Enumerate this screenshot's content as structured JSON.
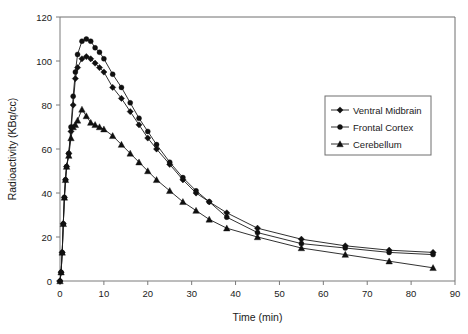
{
  "chart_data": {
    "type": "line",
    "title": "",
    "xlabel": "Time (min)",
    "ylabel": "Radioactivity (KBq/cc)",
    "xlim": [
      0,
      90
    ],
    "ylim": [
      0,
      120
    ],
    "xticks": [
      0,
      10,
      20,
      30,
      40,
      50,
      60,
      70,
      80,
      90
    ],
    "yticks": [
      0,
      20,
      40,
      60,
      80,
      100,
      120
    ],
    "grid": false,
    "legend_position": "right-top",
    "series": [
      {
        "name": "Ventral Midbrain",
        "marker": "diamond",
        "color": "#101010",
        "x": [
          0,
          0.25,
          0.5,
          0.75,
          1,
          1.25,
          1.5,
          2,
          2.5,
          3,
          3.5,
          4,
          5,
          6,
          7,
          8,
          9,
          10,
          12,
          14,
          16,
          18,
          20,
          22,
          25,
          28,
          31,
          34,
          38,
          45,
          55,
          65,
          75,
          85
        ],
        "y": [
          0,
          4,
          13,
          26,
          38,
          46,
          52,
          58,
          68,
          80,
          92,
          97,
          101,
          102,
          101,
          99,
          97,
          95,
          88,
          83,
          77,
          71,
          65,
          60,
          53,
          46,
          40,
          36,
          31,
          24,
          19,
          16,
          14,
          13
        ]
      },
      {
        "name": "Frontal Cortex",
        "marker": "circle",
        "color": "#101010",
        "x": [
          0,
          0.25,
          0.5,
          0.75,
          1,
          1.25,
          1.5,
          2,
          2.5,
          3,
          3.5,
          4,
          5,
          6,
          7,
          8,
          9,
          10,
          12,
          14,
          16,
          18,
          20,
          22,
          25,
          28,
          31,
          34,
          38,
          45,
          55,
          65,
          75,
          85
        ],
        "y": [
          0,
          4,
          13,
          26,
          38,
          46,
          52,
          58,
          70,
          84,
          95,
          103,
          109,
          110,
          109,
          106,
          104,
          101,
          94,
          88,
          81,
          74,
          68,
          62,
          54,
          47,
          41,
          36,
          29,
          22,
          17,
          15,
          13,
          12
        ]
      },
      {
        "name": "Cerebellum",
        "marker": "triangle",
        "color": "#101010",
        "x": [
          0,
          0.25,
          0.5,
          0.75,
          1,
          1.25,
          1.5,
          2,
          2.5,
          3,
          3.5,
          4,
          5,
          6,
          7,
          8,
          9,
          10,
          12,
          14,
          16,
          18,
          20,
          22,
          25,
          28,
          31,
          34,
          38,
          45,
          55,
          65,
          75,
          85
        ],
        "y": [
          0,
          4,
          13,
          26,
          38,
          46,
          52,
          57,
          65,
          70,
          71,
          73,
          78,
          75,
          72,
          71,
          70,
          69,
          66,
          62,
          58,
          54,
          50,
          46,
          41,
          36,
          32,
          28,
          24,
          20,
          15,
          12,
          9,
          6
        ]
      }
    ]
  },
  "legend": {
    "items": [
      {
        "label": "Ventral Midbrain",
        "marker": "diamond"
      },
      {
        "label": "Frontal Cortex",
        "marker": "circle"
      },
      {
        "label": "Cerebellum",
        "marker": "triangle"
      }
    ]
  }
}
